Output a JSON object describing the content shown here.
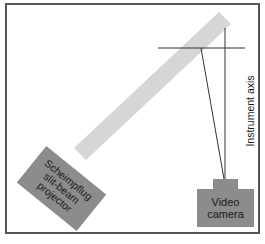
{
  "diagram": {
    "projector": {
      "label_lines": [
        "Scheimpflug",
        "slit-beam",
        "projector"
      ]
    },
    "camera": {
      "label_lines": [
        "Video",
        "camera"
      ]
    },
    "axis": {
      "label": "Instrument axis"
    },
    "colors": {
      "frame": "#555555",
      "beam": "#d6d6d6",
      "device": "#8c8c8c",
      "line": "#333333",
      "text": "#1a1a1a"
    }
  }
}
